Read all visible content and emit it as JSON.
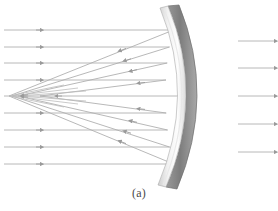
{
  "figure": {
    "caption": "(a)",
    "background_color": "#ffffff"
  },
  "colors": {
    "ray": "#b0b0b0",
    "ray_arrow": "#9a9a9a",
    "mirror_back_dark": "#7d7d7d",
    "mirror_back_light": "#b9b9b9",
    "mirror_face_light": "#fdfdfd",
    "mirror_face_shadow": "#cfcfcf",
    "mirror_outline": "#8a8a8a",
    "caption_text": "#4a4a4a"
  },
  "mirror": {
    "name": "concave-mirror",
    "vertex_x": 183,
    "axis_y": 96,
    "top_y": 6,
    "bottom_y": 187,
    "edge_top_x": 168,
    "edge_bottom_x": 166,
    "thickness": 11,
    "curvature_note": "concave toward the left; reflective surface on left face"
  },
  "optical_axis": {
    "y": 96,
    "x_start": 4,
    "x_end": 183
  },
  "focus_region": {
    "label": "caustic-convergence-point",
    "x": 9,
    "y": 96
  },
  "incoming_rays": {
    "count": 9,
    "x_start": 4,
    "arrow_x": 41,
    "ray_y": [
      30,
      47,
      63,
      80,
      96,
      113,
      130,
      147,
      164
    ],
    "hit_x": [
      173.5,
      169.5,
      167.2,
      166.0,
      183.0,
      166.2,
      167.6,
      170.2,
      174.6
    ]
  },
  "reflected_rays": {
    "count": 8,
    "description": "rays reflect from mirror face back toward the axis, crossing it at different points producing a caustic",
    "segments": [
      {
        "from_x": 173.5,
        "from_y": 30,
        "to_x": 9,
        "to_y": 96,
        "arrow_t": 0.62
      },
      {
        "from_x": 169.5,
        "from_y": 47,
        "to_x": 12,
        "to_y": 96,
        "arrow_t": 0.6
      },
      {
        "from_x": 167.2,
        "from_y": 63,
        "to_x": 18,
        "to_y": 96,
        "arrow_t": 0.58
      },
      {
        "from_x": 166.0,
        "from_y": 80,
        "to_x": 40,
        "to_y": 96,
        "arrow_t": 0.56
      },
      {
        "from_x": 166.2,
        "from_y": 113,
        "to_x": 40,
        "to_y": 96,
        "arrow_t": 0.56
      },
      {
        "from_x": 167.6,
        "from_y": 130,
        "to_x": 18,
        "to_y": 96,
        "arrow_t": 0.58
      },
      {
        "from_x": 169.5,
        "from_y": 147,
        "to_x": 12,
        "to_y": 96,
        "arrow_t": 0.6
      },
      {
        "from_x": 173.5,
        "from_y": 164,
        "to_x": 9,
        "to_y": 96,
        "arrow_t": 0.62
      }
    ]
  },
  "crossing_rays": {
    "description": "reflected rays continue past the axis crossing to the opposite side, forming the X caustic pattern",
    "segments": [
      {
        "from_x": 9,
        "from_y": 96,
        "to_x": 60,
        "to_y": 86
      },
      {
        "from_x": 12,
        "from_y": 96,
        "to_x": 72,
        "to_y": 88
      },
      {
        "from_x": 9,
        "from_y": 96,
        "to_x": 60,
        "to_y": 106
      },
      {
        "from_x": 12,
        "from_y": 96,
        "to_x": 72,
        "to_y": 104
      }
    ]
  },
  "adjacent_figure_rays": {
    "description": "partial parallel ray stubs at the right edge belonging to the neighbouring panel",
    "count": 5,
    "x_start": 238,
    "x_end": 278,
    "ray_y": [
      41,
      68,
      96,
      124,
      152
    ]
  }
}
